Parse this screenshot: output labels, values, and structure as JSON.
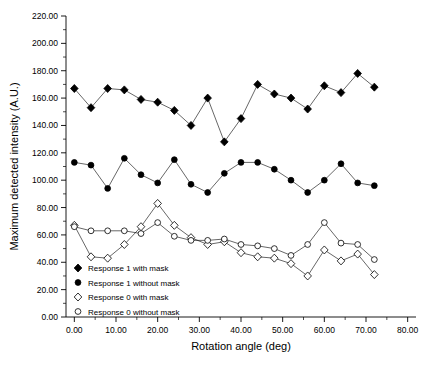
{
  "chart_data": {
    "type": "scatter",
    "title": "",
    "xlabel": "Rotation angle (deg)",
    "ylabel": "Maximum detected intensity (A.U.)",
    "xlim": [
      -2,
      82
    ],
    "ylim": [
      0,
      220
    ],
    "xticks": [
      0,
      10,
      20,
      30,
      40,
      50,
      60,
      70,
      80
    ],
    "xtick_labels": [
      "0.00",
      "10.00",
      "20.00",
      "30.00",
      "40.00",
      "50.00",
      "60.00",
      "70.00",
      "80.00"
    ],
    "yticks": [
      0,
      20,
      40,
      60,
      80,
      100,
      120,
      140,
      160,
      180,
      200,
      220
    ],
    "ytick_labels": [
      "0.00",
      "20.00",
      "40.00",
      "60.00",
      "80.00",
      "100.00",
      "120.00",
      "140.00",
      "160.00",
      "180.00",
      "200.00",
      "220.00"
    ],
    "grid": false,
    "legend_position": "bottom-left",
    "series": [
      {
        "name": "Response 1 with mask",
        "marker": "filled-diamond",
        "color": "#000000",
        "x": [
          0,
          4,
          8,
          12,
          16,
          20,
          24,
          28,
          32,
          36,
          40,
          44,
          48,
          52,
          56,
          60,
          64,
          68,
          72
        ],
        "y": [
          167,
          153,
          167,
          166,
          159,
          157,
          151,
          140,
          160,
          128,
          145,
          170,
          163,
          160,
          152,
          169,
          164,
          178,
          168
        ]
      },
      {
        "name": "Response 1 without mask",
        "marker": "filled-circle",
        "color": "#000000",
        "x": [
          0,
          4,
          8,
          12,
          16,
          20,
          24,
          28,
          32,
          36,
          40,
          44,
          48,
          52,
          56,
          60,
          64,
          68,
          72
        ],
        "y": [
          113,
          111,
          94,
          116,
          104,
          98,
          115,
          97,
          91,
          105,
          113,
          113,
          108,
          100,
          91,
          100,
          112,
          98,
          96
        ]
      },
      {
        "name": "Response 0 with mask",
        "marker": "open-diamond",
        "color": "#000000",
        "x": [
          0,
          4,
          8,
          12,
          16,
          20,
          24,
          28,
          32,
          36,
          40,
          44,
          48,
          52,
          56,
          60,
          64,
          68,
          72
        ],
        "y": [
          67,
          44,
          43,
          53,
          66,
          83,
          67,
          58,
          53,
          55,
          47,
          44,
          43,
          39,
          30,
          49,
          41,
          46,
          31
        ]
      },
      {
        "name": "Response 0 without mask",
        "marker": "open-circle",
        "color": "#000000",
        "x": [
          0,
          4,
          8,
          12,
          16,
          20,
          24,
          28,
          32,
          36,
          40,
          44,
          48,
          52,
          56,
          60,
          64,
          68,
          72
        ],
        "y": [
          66,
          63,
          63,
          63,
          61,
          69,
          59,
          56,
          56,
          57,
          53,
          52,
          50,
          45,
          53,
          69,
          54,
          53,
          42
        ]
      }
    ]
  }
}
